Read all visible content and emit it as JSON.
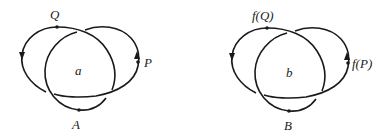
{
  "diagrams": [
    {
      "id": "left",
      "center_label": "a",
      "points": [
        {
          "name": "Q",
          "label": "Q"
        },
        {
          "name": "P",
          "label": "P"
        },
        {
          "name": "A",
          "label": "A"
        }
      ]
    },
    {
      "id": "right",
      "center_label": "b",
      "points": [
        {
          "name": "fQ",
          "label": "f(Q)"
        },
        {
          "name": "fP",
          "label": "f(P)"
        },
        {
          "name": "B",
          "label": "B"
        }
      ]
    }
  ],
  "colors": {
    "stroke": "#1a1a1a",
    "text": "#222222"
  }
}
